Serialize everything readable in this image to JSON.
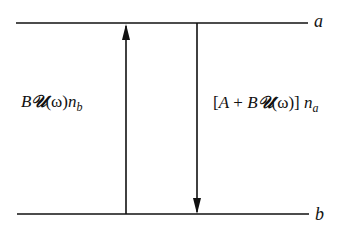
{
  "diagram": {
    "type": "two-level energy diagram",
    "levels": [
      {
        "id": "a",
        "label": "a",
        "y": 23
      },
      {
        "id": "b",
        "label": "b",
        "y": 214
      }
    ],
    "transitions": [
      {
        "id": "absorption",
        "direction": "up",
        "from": "b",
        "to": "a",
        "label": {
          "B": "B",
          "U": "𝒰",
          "omega": "(ω)",
          "n": "n",
          "sub": "b"
        }
      },
      {
        "id": "emission",
        "direction": "down",
        "from": "a",
        "to": "b",
        "label": {
          "open": "[",
          "A": "A",
          "plus": " + ",
          "B": "B",
          "U": "𝒰",
          "omega": "(ω)",
          "close": "]",
          "n": " n",
          "sub": "a"
        }
      }
    ],
    "colors": {
      "line": "#111111",
      "background": "#ffffff"
    }
  }
}
